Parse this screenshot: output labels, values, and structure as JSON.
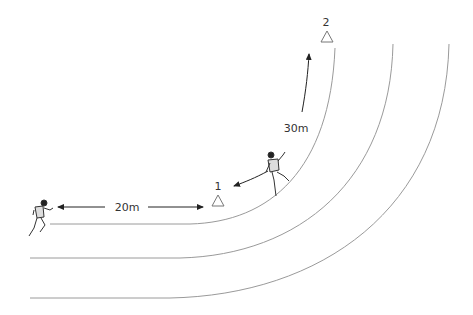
{
  "diagram": {
    "type": "running-drill",
    "colors": {
      "track_line": "#9a9a9a",
      "arrow": "#222222",
      "cone_stroke": "#777777",
      "text": "#333333"
    },
    "cones": [
      {
        "label": "1",
        "x": 217,
        "y": 200
      },
      {
        "label": "2",
        "x": 326,
        "y": 64
      }
    ],
    "distances": [
      {
        "label": "20m",
        "x": 134,
        "y": 210
      },
      {
        "label": "30m",
        "x": 294,
        "y": 131
      }
    ],
    "runners": [
      {
        "name": "runner-start",
        "position": "left, behind start line"
      },
      {
        "name": "runner-curve",
        "position": "on curve between cone 1 and 2"
      }
    ]
  }
}
